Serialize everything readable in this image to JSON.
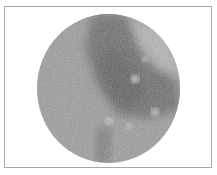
{
  "image": {
    "description": "Grayscale micrograph in circular microscope field of view inside a thin rectangular frame",
    "colors": {
      "frame_border": "#a8a8a8",
      "background": "#ffffff",
      "field_base": "#9a9a9a",
      "dark_region": "#6e6e6e",
      "light_speckle": "#d0d0d0"
    }
  }
}
